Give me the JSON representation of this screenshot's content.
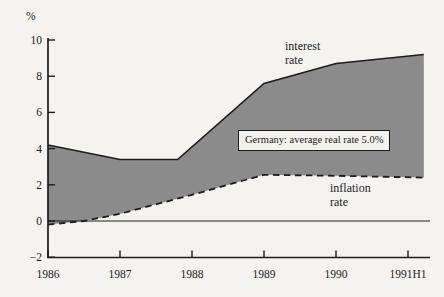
{
  "figure": {
    "interest_label": {
      "line1": "interest",
      "line2": "rate"
    },
    "inflation_label": {
      "line1": "inflation",
      "line2": "rate"
    }
  },
  "chart_data": {
    "type": "area",
    "title": "",
    "xlabel": "",
    "ylabel": "%",
    "ylim": [
      -2,
      10
    ],
    "yticks": [
      10,
      8,
      6,
      4,
      2,
      0,
      -2
    ],
    "x_tick_labels": [
      "1986",
      "1987",
      "1988",
      "1989",
      "1990",
      "1991H1"
    ],
    "x_tick_years": [
      1986,
      1987,
      1988,
      1989,
      1990,
      1991
    ],
    "zero_line": true,
    "grid": false,
    "legend_position": "inline-labels",
    "annotation": "Germany: average real rate 5.0%",
    "area_fill_between": [
      "interest rate",
      "inflation rate"
    ],
    "series": [
      {
        "name": "interest rate",
        "line_style": "solid",
        "points": [
          [
            1986,
            4.2
          ],
          [
            1987,
            3.4
          ],
          [
            1987.8,
            3.4
          ],
          [
            1989,
            7.6
          ],
          [
            1990,
            8.7
          ],
          [
            1991.22,
            9.2
          ]
        ]
      },
      {
        "name": "inflation rate",
        "line_style": "dashed",
        "points": [
          [
            1986,
            -0.2
          ],
          [
            1986.5,
            0.0
          ],
          [
            1987,
            0.4
          ],
          [
            1988,
            1.45
          ],
          [
            1989,
            2.55
          ],
          [
            1990,
            2.5
          ],
          [
            1991.22,
            2.4
          ]
        ]
      }
    ],
    "colors": {
      "line": "#1c1c1c",
      "area_fill": "#8b8b8b",
      "background": "#f4f3f0",
      "annotation_background": "#f3f2ee"
    }
  }
}
